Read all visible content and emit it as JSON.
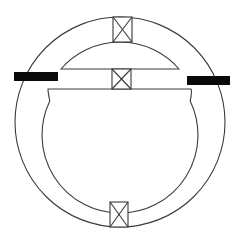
{
  "diagram": {
    "type": "schematic",
    "colors": {
      "line": "#3a3a3a",
      "bar": "#0a0a0a",
      "background": "#ffffff"
    },
    "outer_circle": {
      "cx": 120,
      "cy": 122,
      "r": 105
    },
    "inner_chamber": {
      "cx": 120,
      "cy": 123,
      "r": 78,
      "chord_y": 89,
      "chord_x1": 48,
      "chord_x2": 191
    },
    "upper_segment": {
      "x1": 61,
      "x2": 179,
      "base_y": 69,
      "top_y": 42
    },
    "crossed_boxes": [
      {
        "id": "top",
        "x": 113,
        "y": 17,
        "w": 19,
        "h": 25
      },
      {
        "id": "middle",
        "x": 112,
        "y": 69,
        "w": 19,
        "h": 20
      },
      {
        "id": "bottom",
        "x": 110,
        "y": 202,
        "w": 18,
        "h": 25
      }
    ],
    "bars": [
      {
        "id": "left",
        "x": 14,
        "y": 72,
        "w": 44,
        "h": 9
      },
      {
        "id": "right",
        "x": 187,
        "y": 76,
        "w": 43,
        "h": 9
      }
    ]
  }
}
